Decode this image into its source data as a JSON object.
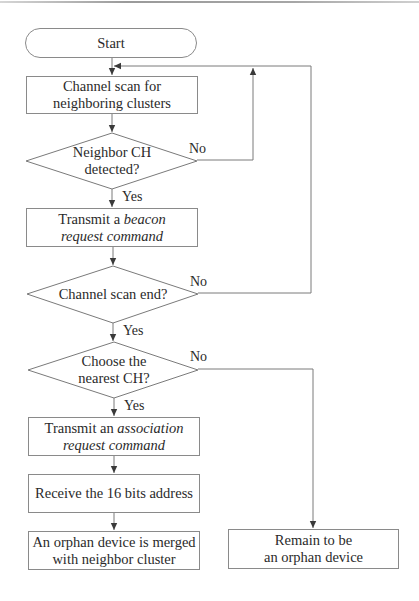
{
  "diagram": {
    "type": "flowchart",
    "nodes": {
      "start": {
        "shape": "terminal",
        "text": "Start"
      },
      "scan": {
        "shape": "process",
        "line1": "Channel scan for",
        "line2": "neighboring clusters"
      },
      "neighbor_detected": {
        "shape": "decision",
        "line1": "Neighbor CH",
        "line2": "detected?"
      },
      "beacon": {
        "shape": "process",
        "line1_plain": "Transmit a ",
        "line1_italic": "beacon",
        "line2_italic": "request command"
      },
      "scan_end": {
        "shape": "decision",
        "text": "Channel scan end?"
      },
      "choose_nearest": {
        "shape": "decision",
        "line1": "Choose the",
        "line2": "nearest CH?"
      },
      "association": {
        "shape": "process",
        "line1_plain": "Transmit an ",
        "line1_italic": "association",
        "line2_italic": "request command"
      },
      "receive_address": {
        "shape": "process",
        "text": "Receive the 16 bits address"
      },
      "merged": {
        "shape": "process",
        "line1": "An orphan device is merged",
        "line2": "with neighbor cluster"
      },
      "remain_orphan": {
        "shape": "process",
        "line1": "Remain to be",
        "line2": "an orphan device"
      }
    },
    "edge_labels": {
      "neighbor_no": "No",
      "neighbor_yes": "Yes",
      "scan_end_no": "No",
      "scan_end_yes": "Yes",
      "choose_no": "No",
      "choose_yes": "Yes"
    },
    "edges": [
      {
        "from": "start",
        "to": "scan"
      },
      {
        "from": "scan",
        "to": "neighbor_detected"
      },
      {
        "from": "neighbor_detected",
        "to": "beacon",
        "label": "Yes"
      },
      {
        "from": "neighbor_detected",
        "to": "scan",
        "label": "No"
      },
      {
        "from": "beacon",
        "to": "scan_end"
      },
      {
        "from": "scan_end",
        "to": "choose_nearest",
        "label": "Yes"
      },
      {
        "from": "scan_end",
        "to": "scan",
        "label": "No"
      },
      {
        "from": "choose_nearest",
        "to": "association",
        "label": "Yes"
      },
      {
        "from": "choose_nearest",
        "to": "remain_orphan",
        "label": "No"
      },
      {
        "from": "association",
        "to": "receive_address"
      },
      {
        "from": "receive_address",
        "to": "merged"
      }
    ],
    "colors": {
      "line": "#7a7a7a",
      "text": "#2a2a2a",
      "background": "#ffffff"
    }
  }
}
